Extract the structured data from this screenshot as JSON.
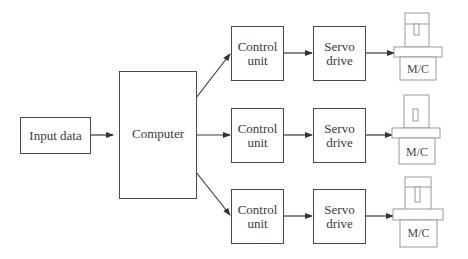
{
  "diagram": {
    "type": "block-diagram",
    "input": {
      "label": "Input data"
    },
    "computer": {
      "label": "Computer"
    },
    "channels": [
      {
        "control_unit": {
          "line1": "Control",
          "line2": "unit"
        },
        "servo_drive": {
          "line1": "Servo",
          "line2": "drive"
        },
        "machine": {
          "label": "M/C"
        }
      },
      {
        "control_unit": {
          "line1": "Control",
          "line2": "unit"
        },
        "servo_drive": {
          "line1": "Servo",
          "line2": "drive"
        },
        "machine": {
          "label": "M/C"
        }
      },
      {
        "control_unit": {
          "line1": "Control",
          "line2": "unit"
        },
        "servo_drive": {
          "line1": "Servo",
          "line2": "drive"
        },
        "machine": {
          "label": "M/C"
        }
      }
    ],
    "edges": [
      {
        "from": "Input data",
        "to": "Computer"
      },
      {
        "from": "Computer",
        "to": "Control unit 1"
      },
      {
        "from": "Computer",
        "to": "Control unit 2"
      },
      {
        "from": "Computer",
        "to": "Control unit 3"
      },
      {
        "from": "Control unit 1",
        "to": "Servo drive 1"
      },
      {
        "from": "Control unit 2",
        "to": "Servo drive 2"
      },
      {
        "from": "Control unit 3",
        "to": "Servo drive 3"
      },
      {
        "from": "Servo drive 1",
        "to": "M/C 1"
      },
      {
        "from": "Servo drive 2",
        "to": "M/C 2"
      },
      {
        "from": "Servo drive 3",
        "to": "M/C 3"
      }
    ]
  },
  "colors": {
    "line": "#3a3a3a",
    "machine_outline": "#9a9a9a"
  }
}
